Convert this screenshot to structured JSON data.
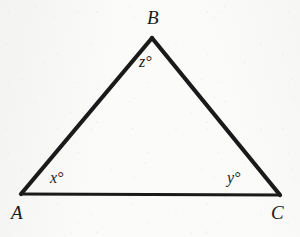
{
  "figure": {
    "kind": "geometry-diagram",
    "shape": "triangle",
    "background_color": "#fbfbfa",
    "ink_color": "#1a1a1a",
    "vertices": [
      {
        "id": "A",
        "label": "A",
        "x": 21,
        "y": 194,
        "label_x": 11,
        "label_y": 203
      },
      {
        "id": "B",
        "label": "B",
        "x": 152,
        "y": 38,
        "label_x": 147,
        "label_y": 8
      },
      {
        "id": "C",
        "label": "C",
        "x": 280,
        "y": 195,
        "label_x": 271,
        "label_y": 203
      }
    ],
    "angles": [
      {
        "at_vertex": "A",
        "label": "x°",
        "label_x": 50,
        "label_y": 170
      },
      {
        "at_vertex": "C",
        "label": "y°",
        "label_x": 227,
        "label_y": 170
      },
      {
        "at_vertex": "B",
        "label": "z°",
        "label_x": 139,
        "label_y": 54
      }
    ],
    "sides": [
      {
        "id": "AB",
        "from": "A",
        "to": "B",
        "stroke_width": 4.2
      },
      {
        "id": "BC",
        "from": "B",
        "to": "C",
        "stroke_width": 4.2
      },
      {
        "id": "CA",
        "from": "C",
        "to": "A",
        "stroke_width": 3.0
      }
    ]
  }
}
